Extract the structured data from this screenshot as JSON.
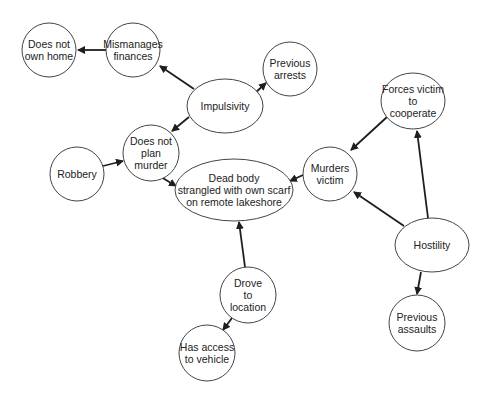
{
  "diagram": {
    "type": "directed-graph",
    "nodes": [
      {
        "id": "does_not_own_home",
        "label": "Does not\nown home",
        "shape": "circle",
        "cx": 49,
        "cy": 50,
        "rx": 27,
        "ry": 27
      },
      {
        "id": "mismanages_finances",
        "label": "Mismanages\nfinances",
        "shape": "circle",
        "cx": 133,
        "cy": 50,
        "rx": 27,
        "ry": 27
      },
      {
        "id": "previous_arrests",
        "label": "Previous\narrests",
        "shape": "circle",
        "cx": 290,
        "cy": 69,
        "rx": 27,
        "ry": 27
      },
      {
        "id": "impulsivity",
        "label": "Impulsivity",
        "shape": "ellipse",
        "cx": 225,
        "cy": 106,
        "rx": 38,
        "ry": 27
      },
      {
        "id": "does_not_plan_murder",
        "label": "Does not\nplan\nmurder",
        "shape": "circle",
        "cx": 151,
        "cy": 153,
        "rx": 28,
        "ry": 28
      },
      {
        "id": "robbery",
        "label": "Robbery",
        "shape": "circle",
        "cx": 77,
        "cy": 174,
        "rx": 27,
        "ry": 27
      },
      {
        "id": "dead_body",
        "label": "Dead body\nstrangled with own scarf\non remote lakeshore",
        "shape": "ellipse",
        "cx": 234,
        "cy": 190,
        "rx": 59,
        "ry": 31
      },
      {
        "id": "murders_victim",
        "label": "Murders\nvictim",
        "shape": "circle",
        "cx": 330,
        "cy": 174,
        "rx": 27,
        "ry": 27
      },
      {
        "id": "forces_victim",
        "label": "Forces victim\nto\ncooperate",
        "shape": "circle",
        "cx": 413,
        "cy": 101,
        "rx": 32,
        "ry": 28
      },
      {
        "id": "hostility",
        "label": "Hostility",
        "shape": "ellipse",
        "cx": 432,
        "cy": 245,
        "rx": 37,
        "ry": 27
      },
      {
        "id": "previous_assaults",
        "label": "Previous\nassaults",
        "shape": "circle",
        "cx": 417,
        "cy": 323,
        "rx": 28,
        "ry": 28
      },
      {
        "id": "drove_to_location",
        "label": "Drove\nto\nlocation",
        "shape": "circle",
        "cx": 248,
        "cy": 295,
        "rx": 28,
        "ry": 28
      },
      {
        "id": "has_access_vehicle",
        "label": "Has access\nto vehicle",
        "shape": "circle",
        "cx": 207,
        "cy": 353,
        "rx": 28,
        "ry": 28
      }
    ],
    "edges": [
      {
        "from": "mismanages_finances",
        "to": "does_not_own_home",
        "x1": 106,
        "y1": 50,
        "x2": 78,
        "y2": 50
      },
      {
        "from": "impulsivity",
        "to": "mismanages_finances",
        "x1": 194,
        "y1": 89,
        "x2": 160,
        "y2": 66
      },
      {
        "from": "impulsivity",
        "to": "previous_arrests",
        "x1": 254,
        "y1": 94,
        "x2": 266,
        "y2": 83
      },
      {
        "from": "impulsivity",
        "to": "does_not_plan_murder",
        "x1": 189,
        "y1": 117,
        "x2": 172,
        "y2": 131
      },
      {
        "from": "robbery",
        "to": "does_not_plan_murder",
        "x1": 103,
        "y1": 166,
        "x2": 123,
        "y2": 161
      },
      {
        "from": "does_not_plan_murder",
        "to": "dead_body",
        "x1": 161,
        "y1": 177,
        "x2": 176,
        "y2": 186
      },
      {
        "from": "murders_victim",
        "to": "dead_body",
        "x1": 303,
        "y1": 175,
        "x2": 290,
        "y2": 181
      },
      {
        "from": "forces_victim",
        "to": "murders_victim",
        "x1": 387,
        "y1": 117,
        "x2": 351,
        "y2": 150
      },
      {
        "from": "hostility",
        "to": "forces_victim",
        "x1": 428,
        "y1": 218,
        "x2": 417,
        "y2": 131
      },
      {
        "from": "hostility",
        "to": "murders_victim",
        "x1": 404,
        "y1": 226,
        "x2": 354,
        "y2": 192
      },
      {
        "from": "hostility",
        "to": "previous_assaults",
        "x1": 421,
        "y1": 272,
        "x2": 417,
        "y2": 294
      },
      {
        "from": "drove_to_location",
        "to": "dead_body",
        "x1": 245,
        "y1": 267,
        "x2": 239,
        "y2": 222
      },
      {
        "from": "drove_to_location",
        "to": "has_access_vehicle",
        "x1": 232,
        "y1": 318,
        "x2": 223,
        "y2": 330
      }
    ],
    "colors": {
      "node_stroke": "#444444",
      "edge": "#1e1e1e",
      "text": "#222222",
      "background": "#ffffff"
    }
  }
}
